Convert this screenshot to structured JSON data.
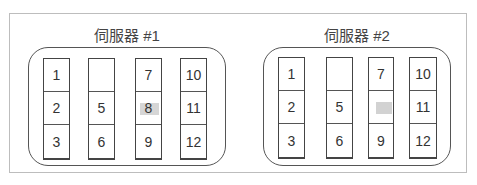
{
  "servers": [
    {
      "title": "伺服器 #1",
      "columns": [
        {
          "slots": [
            {
              "label": "1",
              "highlight": false
            },
            {
              "label": "2",
              "highlight": false
            },
            {
              "label": "3",
              "highlight": false
            }
          ]
        },
        {
          "slots": [
            {
              "label": "",
              "highlight": false
            },
            {
              "label": "5",
              "highlight": false
            },
            {
              "label": "6",
              "highlight": false
            }
          ]
        },
        {
          "slots": [
            {
              "label": "7",
              "highlight": false
            },
            {
              "label": "8",
              "highlight": true
            },
            {
              "label": "9",
              "highlight": false
            }
          ]
        },
        {
          "slots": [
            {
              "label": "10",
              "highlight": false
            },
            {
              "label": "11",
              "highlight": false
            },
            {
              "label": "12",
              "highlight": false
            }
          ]
        }
      ]
    },
    {
      "title": "伺服器 #2",
      "columns": [
        {
          "slots": [
            {
              "label": "1",
              "highlight": false
            },
            {
              "label": "2",
              "highlight": false
            },
            {
              "label": "3",
              "highlight": false
            }
          ]
        },
        {
          "slots": [
            {
              "label": "",
              "highlight": false
            },
            {
              "label": "5",
              "highlight": false
            },
            {
              "label": "6",
              "highlight": false
            }
          ]
        },
        {
          "slots": [
            {
              "label": "7",
              "highlight": false
            },
            {
              "label": "",
              "highlight": true
            },
            {
              "label": "9",
              "highlight": false
            }
          ]
        },
        {
          "slots": [
            {
              "label": "10",
              "highlight": false
            },
            {
              "label": "11",
              "highlight": false
            },
            {
              "label": "12",
              "highlight": false
            }
          ]
        }
      ]
    }
  ]
}
